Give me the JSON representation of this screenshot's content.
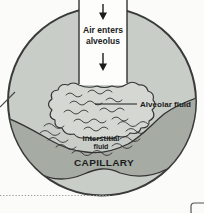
{
  "figure": {
    "labels": {
      "air_line1": "Air enters",
      "air_line2": "alveolus",
      "alveolar_fluid": "Alveolar fluid",
      "interstitial_line1": "Interstitial",
      "interstitial_line2": "fluid",
      "capillary": "CAPILLARY"
    },
    "icons": {
      "air_flow": "down-arrow"
    },
    "colors": {
      "background": "#fbfbf9",
      "circle_fill": "#c9cdc7",
      "capillary_band": "#a6aba4",
      "fluid_blob": "#d5d8d2",
      "air_channel": "#fdfdfc",
      "outline": "#3a3a3a",
      "text": "#1c1c1c"
    }
  }
}
